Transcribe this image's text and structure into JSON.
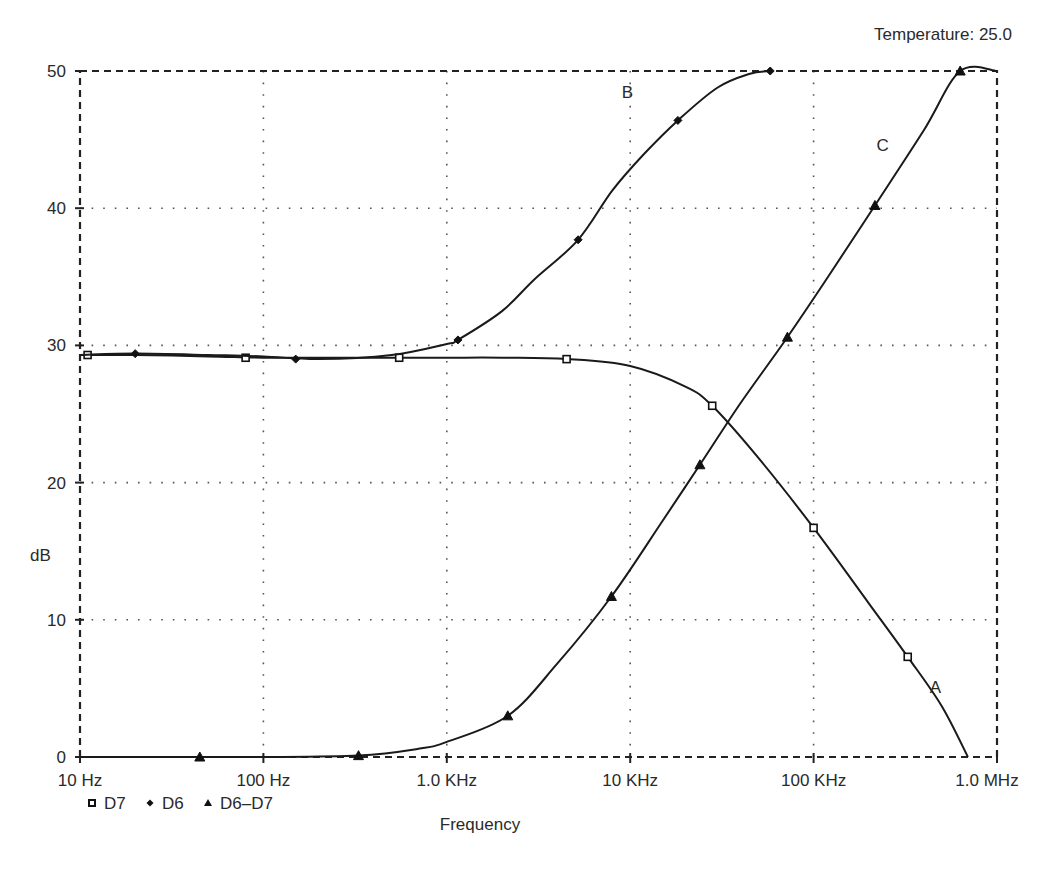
{
  "header": {
    "temperature_label": "Temperature: 25.0"
  },
  "axes": {
    "ylabel": "dB",
    "xlabel": "Frequency",
    "y_ticks": [
      "0",
      "10",
      "20",
      "30",
      "40",
      "50"
    ],
    "x_ticks": [
      "10 Hz",
      "100 Hz",
      "1.0 KHz",
      "10 KHz",
      "100 KHz",
      "1.0 MHz"
    ]
  },
  "legend": [
    {
      "label": "D7",
      "marker": "square"
    },
    {
      "label": "D6",
      "marker": "diamond"
    },
    {
      "label": "D6–D7",
      "marker": "triangle"
    }
  ],
  "annotations": [
    {
      "text": "A",
      "series": "D7",
      "f": 430000,
      "db": 4.7
    },
    {
      "text": "B",
      "series": "D6",
      "f": 9000,
      "db": 48.0
    },
    {
      "text": "C",
      "series": "D6–D7",
      "f": 220000,
      "db": 44.2
    }
  ],
  "chart_data": {
    "type": "line",
    "title": "",
    "subtitle": "Temperature: 25.0",
    "xlabel": "Frequency",
    "ylabel": "dB",
    "xscale": "log",
    "xlim": [
      10,
      1000000
    ],
    "ylim": [
      0,
      50
    ],
    "grid": true,
    "legend_position": "bottom-left",
    "x_tick_labels": [
      "10Hz",
      "100Hz",
      "1.0KHz",
      "10KHz",
      "100KHz",
      "1.0MHz"
    ],
    "y_tick_labels": [
      "0",
      "10",
      "20",
      "30",
      "40",
      "50"
    ],
    "series": [
      {
        "name": "D7",
        "label": "A",
        "marker": "square",
        "x": [
          10,
          20,
          50,
          100,
          200,
          500,
          1000,
          2000,
          4500,
          10000,
          20000,
          28000,
          50000,
          100000,
          200000,
          326000,
          500000,
          694000
        ],
        "y": [
          29.3,
          29.3,
          29.2,
          29.1,
          29.1,
          29.1,
          29.1,
          29.1,
          29.0,
          28.5,
          27.0,
          25.6,
          21.8,
          16.7,
          11.2,
          7.3,
          3.7,
          0.0
        ],
        "marker_x": [
          11,
          80,
          550,
          4500,
          28000,
          100000,
          326000
        ],
        "marker_y": [
          29.3,
          29.1,
          29.1,
          29.0,
          25.6,
          16.7,
          7.3
        ]
      },
      {
        "name": "D6",
        "label": "B",
        "marker": "diamond",
        "x": [
          10,
          20,
          50,
          100,
          200,
          500,
          1000,
          1150,
          2000,
          3000,
          5200,
          8000,
          12000,
          18200,
          30000,
          45000,
          58000
        ],
        "y": [
          29.3,
          29.4,
          29.3,
          29.2,
          29.0,
          29.3,
          30.1,
          30.4,
          32.5,
          34.8,
          37.7,
          41.3,
          44.0,
          46.4,
          48.8,
          49.8,
          50.0
        ],
        "marker_x": [
          20,
          150,
          1150,
          5200,
          18200,
          58000
        ],
        "marker_y": [
          29.4,
          29.0,
          30.4,
          37.7,
          46.4,
          50.0
        ]
      },
      {
        "name": "D6–D7",
        "label": "C",
        "marker": "triangle",
        "x": [
          10,
          50,
          100,
          330,
          700,
          1000,
          2150,
          4000,
          7900,
          15000,
          24000,
          40000,
          72000,
          120000,
          216000,
          400000,
          630000,
          1000000
        ],
        "y": [
          0.0,
          0.0,
          0.0,
          0.1,
          0.6,
          1.1,
          3.0,
          6.8,
          11.7,
          17.2,
          21.3,
          25.8,
          30.6,
          35.0,
          40.2,
          45.7,
          50.0,
          50.0
        ],
        "marker_x": [
          45,
          330,
          2150,
          7900,
          24000,
          72000,
          216000,
          630000
        ],
        "marker_y": [
          0.0,
          0.1,
          3.0,
          11.7,
          21.3,
          30.6,
          40.2,
          50.0
        ]
      }
    ]
  },
  "colors": {
    "line": "#1a1a1a",
    "grid": "#555555",
    "background": "#ffffff",
    "text": "#2a2a2a"
  }
}
